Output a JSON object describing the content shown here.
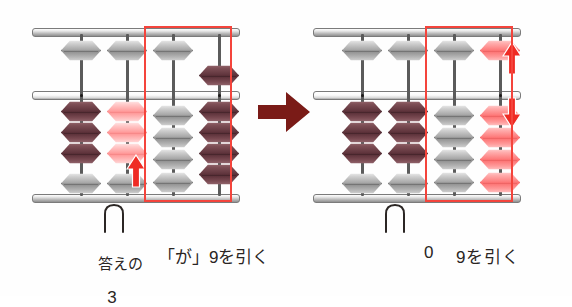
{
  "colors": {
    "highlight_box": "#f4443c",
    "arrow_red": "#ef2b24",
    "arrow_maroon": "#7a1b17",
    "bead_gray": "#a5a5a5",
    "bead_dark": "#5f343c",
    "bead_pink": "#fd7b7b",
    "text": "#2a2523"
  },
  "transition": {
    "icon": "right-arrow-icon",
    "glyph": "→"
  },
  "left_abacus": {
    "name": "before-state",
    "rod_count": 4,
    "rods": [
      {
        "index": 1,
        "heaven": {
          "color": "gray",
          "position": "up",
          "active": false
        },
        "earth": [
          {
            "color": "dark",
            "raised": true
          },
          {
            "color": "dark",
            "raised": true
          },
          {
            "color": "dark",
            "raised": true
          },
          {
            "color": "gray",
            "raised": false
          }
        ]
      },
      {
        "index": 2,
        "heaven": {
          "color": "gray",
          "position": "up",
          "active": false
        },
        "earth": [
          {
            "color": "palepink",
            "raised": true
          },
          {
            "color": "palepink",
            "raised": true
          },
          {
            "color": "palepink",
            "raised": true
          },
          {
            "color": "gray",
            "raised": false
          }
        ]
      },
      {
        "index": 3,
        "heaven": {
          "color": "gray",
          "position": "up",
          "active": false
        },
        "earth": [
          {
            "color": "gray",
            "raised": false
          },
          {
            "color": "gray",
            "raised": false
          },
          {
            "color": "gray",
            "raised": false
          },
          {
            "color": "gray",
            "raised": false
          }
        ]
      },
      {
        "index": 4,
        "heaven": {
          "color": "dark",
          "position": "down",
          "active": true
        },
        "earth": [
          {
            "color": "dark",
            "raised": true
          },
          {
            "color": "dark",
            "raised": true
          },
          {
            "color": "dark",
            "raised": true
          },
          {
            "color": "dark",
            "raised": true
          }
        ]
      }
    ],
    "highlight": {
      "covers_rods": [
        3,
        4
      ]
    },
    "arrows": [
      {
        "name": "up-arrow",
        "direction": "up",
        "rod": 2
      }
    ],
    "finger": {
      "under_rod": 2
    },
    "captions": {
      "answer_label": "答えの",
      "answer_value": "3",
      "action": "「が」9を引く"
    }
  },
  "right_abacus": {
    "name": "after-state",
    "rod_count": 4,
    "rods": [
      {
        "index": 1,
        "heaven": {
          "color": "gray",
          "position": "up",
          "active": false
        },
        "earth": [
          {
            "color": "dark",
            "raised": true
          },
          {
            "color": "dark",
            "raised": true
          },
          {
            "color": "dark",
            "raised": true
          },
          {
            "color": "gray",
            "raised": false
          }
        ]
      },
      {
        "index": 2,
        "heaven": {
          "color": "gray",
          "position": "up",
          "active": false
        },
        "earth": [
          {
            "color": "dark",
            "raised": true
          },
          {
            "color": "dark",
            "raised": true
          },
          {
            "color": "dark",
            "raised": true
          },
          {
            "color": "gray",
            "raised": false
          }
        ]
      },
      {
        "index": 3,
        "heaven": {
          "color": "gray",
          "position": "up",
          "active": false
        },
        "earth": [
          {
            "color": "gray",
            "raised": false
          },
          {
            "color": "gray",
            "raised": false
          },
          {
            "color": "gray",
            "raised": false
          },
          {
            "color": "gray",
            "raised": false
          }
        ]
      },
      {
        "index": 4,
        "heaven": {
          "color": "pink",
          "position": "up",
          "active": true
        },
        "earth": [
          {
            "color": "pink",
            "raised": false
          },
          {
            "color": "pink",
            "raised": false
          },
          {
            "color": "pink",
            "raised": false
          },
          {
            "color": "pink",
            "raised": false
          }
        ]
      }
    ],
    "highlight": {
      "covers_rods": [
        3,
        4
      ]
    },
    "arrows": [
      {
        "name": "up-arrow",
        "direction": "up",
        "rod": 4
      },
      {
        "name": "down-arrow",
        "direction": "down",
        "rod": 4
      }
    ],
    "finger": {
      "under_rod": 2
    },
    "captions": {
      "result_digit": "0",
      "action": "9を引く"
    }
  }
}
